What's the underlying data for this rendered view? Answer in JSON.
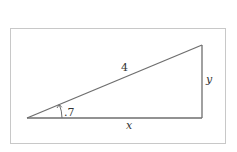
{
  "diagram": {
    "type": "right-triangle",
    "frame": {
      "x": 10,
      "y": 28,
      "width": 216,
      "height": 116,
      "stroke": "#c8c8c8"
    },
    "vertices": {
      "left": [
        27,
        118
      ],
      "right_bottom": [
        202,
        118
      ],
      "right_top": [
        202,
        45
      ]
    },
    "line_color": "#6e6e6e",
    "labels": {
      "hypotenuse": "4",
      "vertical_side": "y",
      "horizontal_side": "x",
      "angle": ".7"
    },
    "angle_marker": {
      "at": "left",
      "radius": 35,
      "arrow": true
    }
  }
}
